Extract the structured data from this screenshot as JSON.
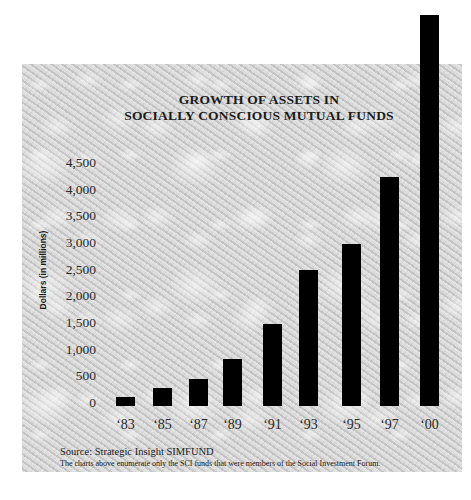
{
  "chart_data": {
    "type": "bar",
    "title": "GROWTH OF ASSETS IN SOCIALLY CONSCIOUS MUTUAL FUNDS",
    "title_lines": [
      "GROWTH OF ASSETS IN",
      "SOCIALLY CONSCIOUS MUTUAL FUNDS"
    ],
    "xlabel": "",
    "ylabel": "Dollars (in millions)",
    "categories": [
      "‘83",
      "‘85",
      "‘87",
      "‘89",
      "‘91",
      "‘93",
      "‘95",
      "‘97",
      "‘00"
    ],
    "values": [
      170,
      340,
      500,
      880,
      1540,
      2550,
      3040,
      4290,
      7330
    ],
    "yticks": [
      "4,500",
      "4,000",
      "3,500",
      "3,000",
      "2,500",
      "2,000",
      "1,500",
      "1,000",
      "500",
      "0"
    ],
    "ylim": [
      0,
      4500
    ],
    "grid": false,
    "legend": null,
    "bar_color": "#000000",
    "annotations": [
      "‘00 bar extends beyond the top of the axis range"
    ]
  },
  "footer": {
    "source": "Source: Strategic Insight SIMFUND",
    "note": "The charts above enumerate only the SCI funds that were members of the Social Investment Forum."
  }
}
